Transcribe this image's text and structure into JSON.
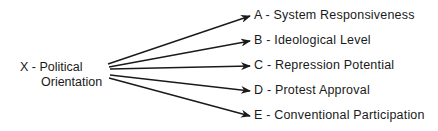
{
  "source": {
    "line1": "X - Political",
    "line2": "Orientation"
  },
  "targets": [
    {
      "label": "A - System Responsiveness"
    },
    {
      "label": "B - Ideological Level"
    },
    {
      "label": "C - Repression Potential"
    },
    {
      "label": "D - Protest Approval"
    },
    {
      "label": "E - Conventional Participation"
    }
  ],
  "colors": {
    "line": "#1a1a1a",
    "background": "#ffffff"
  }
}
